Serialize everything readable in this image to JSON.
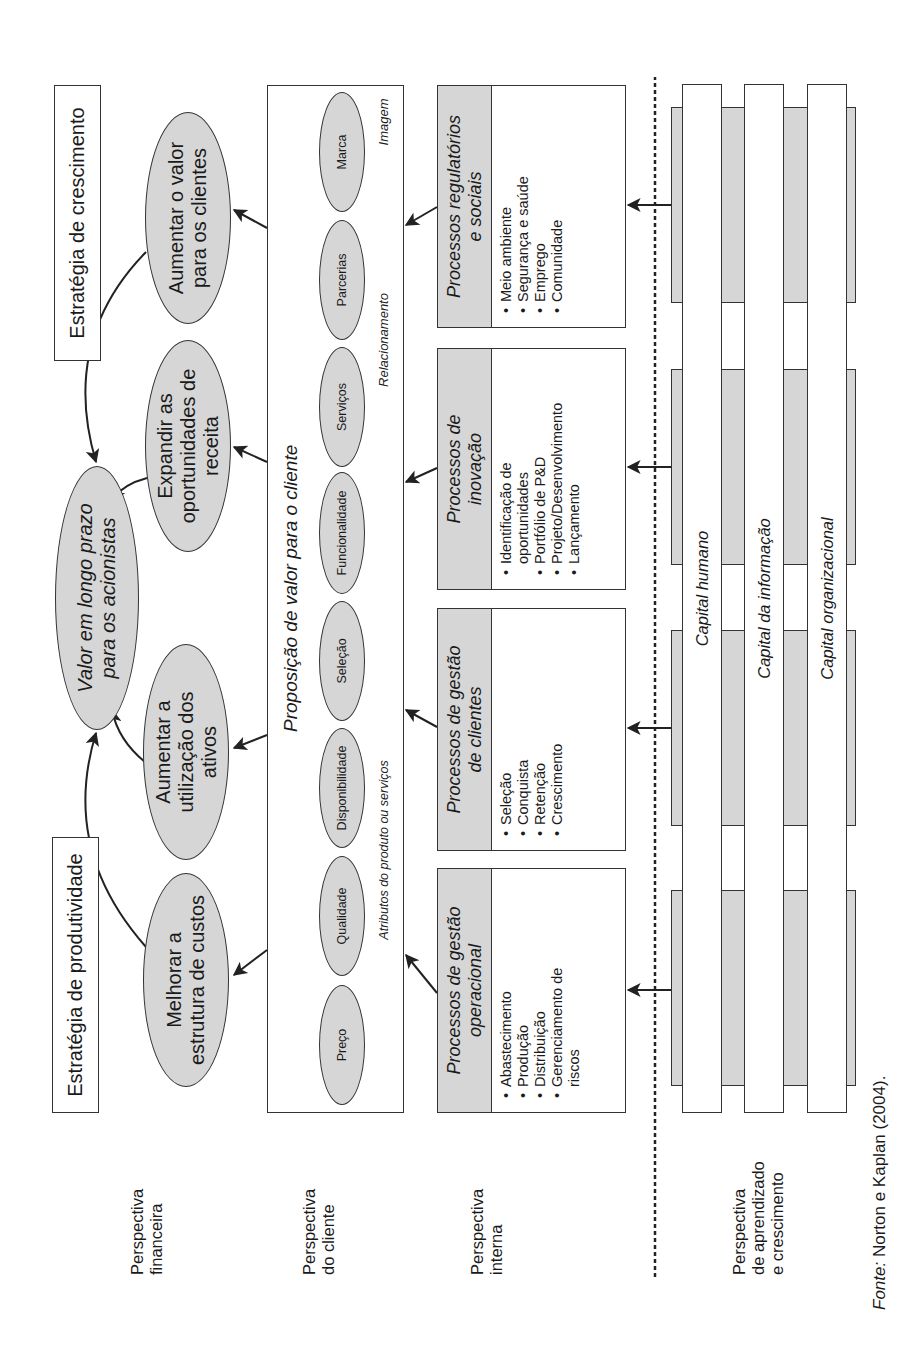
{
  "figure": {
    "rotation_deg": -90
  },
  "strategies": {
    "productivity": "Estratégia de produtividade",
    "growth": "Estratégia de crescimento"
  },
  "perspectives": {
    "financial": [
      "Perspectiva",
      "financeira"
    ],
    "customer": [
      "Perspectiva",
      "do cliente"
    ],
    "internal": [
      "Perspectiva",
      "interna"
    ],
    "learning": [
      "Perspectiva",
      "de aprendizado",
      "e crescimento"
    ]
  },
  "financial": {
    "central": [
      "Valor em longo prazo",
      "para os acionistas"
    ],
    "objectives": [
      {
        "id": "custos",
        "lines": [
          "Melhorar a",
          "estrutura de custos"
        ]
      },
      {
        "id": "ativos",
        "lines": [
          "Aumentar a",
          "utilização dos",
          "ativos"
        ]
      },
      {
        "id": "receita",
        "lines": [
          "Expandir as",
          "oportunidades de",
          "receita"
        ]
      },
      {
        "id": "valor",
        "lines": [
          "Aumentar o valor",
          "para os clientes"
        ]
      }
    ]
  },
  "customer": {
    "title": "Proposição de valor para o cliente",
    "attributes": [
      "Preço",
      "Qualidade",
      "Disponibilidade",
      "Seleção",
      "Funcionalidade",
      "Serviços",
      "Parcerias",
      "Marca"
    ],
    "groups": {
      "product": "Atributos do produto ou serviços",
      "relationship": "Relacionamento",
      "image": "Imagem"
    }
  },
  "internal": {
    "processes": [
      {
        "title": [
          "Processos de gestão",
          "operacional"
        ],
        "items": [
          "Abastecimento",
          "Produção",
          "Distribuição",
          "Gerenciamento de",
          "riscos"
        ]
      },
      {
        "title": [
          "Processos de gestão",
          "de clientes"
        ],
        "items": [
          "Seleção",
          "Conquista",
          "Retenção",
          "Crescimento"
        ]
      },
      {
        "title": [
          "Processos de",
          "inovação"
        ],
        "items": [
          "Identificação de",
          "oportunidades",
          "Portfólio de P&D",
          "Projeto/Desenvolvimento",
          "Lançamento"
        ]
      },
      {
        "title": [
          "Processos regulatórios",
          "e sociais"
        ],
        "items": [
          "Meio ambiente",
          "Segurança e saúde",
          "Emprego",
          "Comunidade"
        ]
      }
    ]
  },
  "learning": {
    "capitals": [
      "Capital humano",
      "Capital da informação",
      "Capital organizacional"
    ]
  },
  "source": {
    "prefix": "Fonte:",
    "text": " Norton e Kaplan (2004)."
  },
  "colors": {
    "fill_gray": "#d6d6d6",
    "stroke": "#333333",
    "background": "#ffffff"
  }
}
